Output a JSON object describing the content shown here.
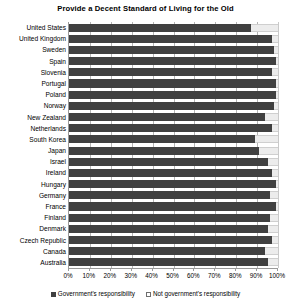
{
  "chart_data": {
    "type": "bar",
    "orientation": "horizontal",
    "stacked": true,
    "stacked_percent": true,
    "title": "Provide a Decent Standard of Living for the Old",
    "xlabel": "",
    "ylabel": "",
    "xlim": [
      0,
      100
    ],
    "xticks": [
      0,
      10,
      20,
      30,
      40,
      50,
      60,
      70,
      80,
      90,
      100
    ],
    "xtick_labels": [
      "0%",
      "10%",
      "20%",
      "30%",
      "40%",
      "50%",
      "60%",
      "70%",
      "80%",
      "90%",
      "100%"
    ],
    "grid": true,
    "grid_axis": "x",
    "legend_position": "bottom",
    "categories": [
      "United States",
      "United Kingdom",
      "Sweden",
      "Spain",
      "Slovenia",
      "Portugal",
      "Poland",
      "Norway",
      "New Zealand",
      "Netherlands",
      "South Korea",
      "Japan",
      "Israel",
      "Ireland",
      "Hungary",
      "Germany",
      "France",
      "Finland",
      "Denmark",
      "Czech Republic",
      "Canada",
      "Australia"
    ],
    "series": [
      {
        "name": "Government's responsibility",
        "color": "#404040",
        "values": [
          87,
          97,
          98,
          99,
          97,
          99,
          99,
          98,
          94,
          97,
          89,
          91,
          95,
          97,
          99,
          96,
          99,
          96,
          95,
          97,
          94,
          95
        ]
      },
      {
        "name": "Not government's responsibility",
        "color": "#ececec",
        "values": [
          13,
          3,
          2,
          1,
          3,
          1,
          1,
          2,
          6,
          3,
          11,
          9,
          5,
          3,
          1,
          4,
          1,
          4,
          5,
          3,
          6,
          5
        ]
      }
    ]
  },
  "legend": {
    "items": [
      {
        "label": "Government's responsibility",
        "swatch": "gov"
      },
      {
        "label": "Not government's responsibility",
        "swatch": "notgov"
      }
    ]
  }
}
